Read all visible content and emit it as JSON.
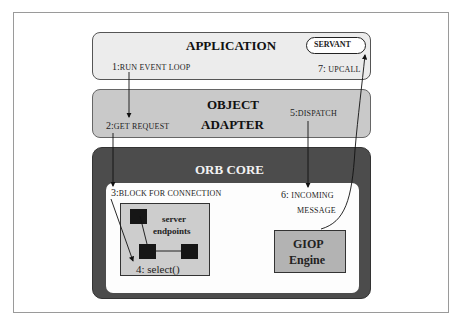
{
  "layers": {
    "application": {
      "title": "APPLICATION",
      "servant": "SERVANT"
    },
    "object_adapter": {
      "title_line1": "OBJECT",
      "title_line2": "ADAPTER"
    },
    "orb_core": {
      "title": "ORB   CORE"
    },
    "endpoints": {
      "label_line1": "server",
      "label_line2": "endpoints",
      "select": "4: select()"
    },
    "giop": {
      "line1": "GIOP",
      "line2": "Engine"
    }
  },
  "steps": {
    "s1": {
      "num": "1:",
      "text": "RUN EVENT LOOP"
    },
    "s2": {
      "num": "2:",
      "text": "GET REQUEST"
    },
    "s3": {
      "num": "3:",
      "text": "BLOCK FOR CONNECTION"
    },
    "s5": {
      "num": "5:",
      "text": "DISPATCH"
    },
    "s6": {
      "num": "6:",
      "text": "INCOMING",
      "text2": "MESSAGE"
    },
    "s7": {
      "num": "7:",
      "text": "UPCALL"
    }
  },
  "colors": {
    "application_fill": "#ececec",
    "adapter_fill": "#c9c9c9",
    "orb_fill": "#4c4c4c",
    "endpoints_fill": "#cdcdcd",
    "giop_fill": "#b3b3b3"
  }
}
